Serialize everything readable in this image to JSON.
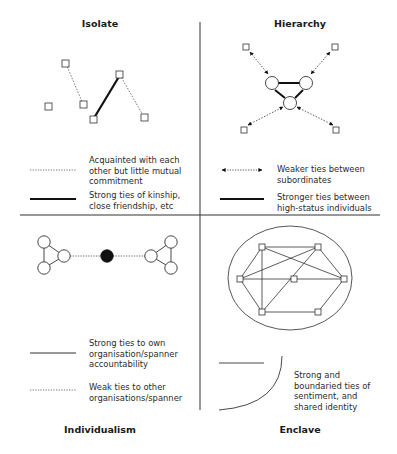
{
  "quadrants": {
    "isolate": {
      "title": "Isolate",
      "legend": [
        {
          "style": "dotted",
          "text": "Acquainted with each other but little mutual commitment"
        },
        {
          "style": "thick",
          "text": "Strong ties of kinship, close friendship, etc"
        }
      ]
    },
    "hierarchy": {
      "title": "Hierarchy",
      "legend": [
        {
          "style": "dotted-double-arrow",
          "text": "Weaker ties between subordinates"
        },
        {
          "style": "thick",
          "text": "Stronger ties between high-status individuals"
        }
      ]
    },
    "individualism": {
      "title": "Individualism",
      "legend": [
        {
          "style": "solid",
          "text": "Strong ties to own organisation/spanner accountability"
        },
        {
          "style": "dotted",
          "text": "Weak ties to other organisations/spanner"
        }
      ]
    },
    "enclave": {
      "title": "Enclave",
      "legend": [
        {
          "style": "boundary-arc",
          "text": "Strong and boundaried ties of sentiment, and shared identity"
        }
      ]
    }
  }
}
